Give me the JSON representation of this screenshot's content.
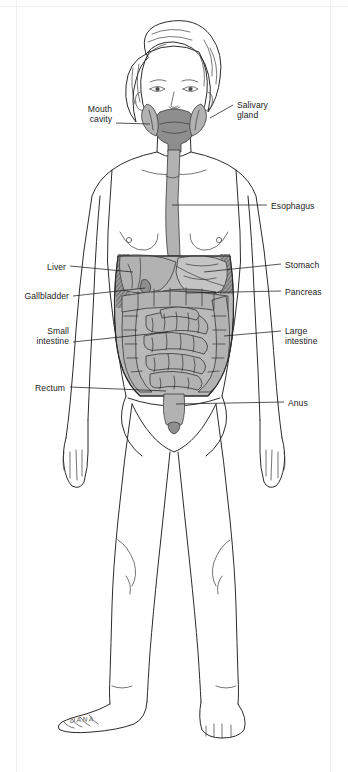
{
  "document": {
    "title": "Digestive system of the human body",
    "header_faint_text": " ",
    "signature": "DANA"
  },
  "figure": {
    "body_outline_color": "#2b2b2b",
    "organ_fill_color": "#b2b2b2",
    "organ_shade_color": "#8e8e8e",
    "organ_dark_color": "#4a4a4a",
    "background_color": "#ffffff"
  },
  "labels": [
    {
      "id": "mouth-cavity",
      "text": "Mouth\ncavity",
      "side": "left",
      "x": 68,
      "y": 104,
      "width": 44,
      "leader": {
        "x1": 116,
        "y1": 123,
        "x2": 150,
        "y2": 124
      }
    },
    {
      "id": "salivary-gland",
      "text": "Salivary\ngland",
      "side": "right",
      "x": 237,
      "y": 100,
      "width": 60,
      "leader": {
        "x1": 233,
        "y1": 105,
        "x2": 210,
        "y2": 118
      }
    },
    {
      "id": "esophagus",
      "text": "Esophagus",
      "side": "right",
      "x": 271,
      "y": 201,
      "width": 62,
      "leader": {
        "x1": 267,
        "y1": 205,
        "x2": 172,
        "y2": 205
      }
    },
    {
      "id": "liver",
      "text": "Liver",
      "side": "left",
      "x": 38,
      "y": 262,
      "width": 28,
      "leader": {
        "x1": 70,
        "y1": 266,
        "x2": 133,
        "y2": 272
      }
    },
    {
      "id": "stomach",
      "text": "Stomach",
      "side": "right",
      "x": 285,
      "y": 260,
      "width": 54,
      "leader": {
        "x1": 281,
        "y1": 264,
        "x2": 204,
        "y2": 272
      }
    },
    {
      "id": "gallbladder",
      "text": "Gallbladder",
      "side": "left",
      "x": 13,
      "y": 291,
      "width": 56,
      "leader": {
        "x1": 73,
        "y1": 296,
        "x2": 139,
        "y2": 290
      }
    },
    {
      "id": "pancreas",
      "text": "Pancreas",
      "side": "right",
      "x": 285,
      "y": 287,
      "width": 54,
      "leader": {
        "x1": 281,
        "y1": 291,
        "x2": 186,
        "y2": 293
      }
    },
    {
      "id": "small-intestine",
      "text": "Small\nintestine",
      "side": "left",
      "x": 20,
      "y": 326,
      "width": 49,
      "leader": {
        "x1": 73,
        "y1": 342,
        "x2": 168,
        "y2": 332
      }
    },
    {
      "id": "large-intestine",
      "text": "Large\nintestine",
      "side": "right",
      "x": 285,
      "y": 326,
      "width": 52,
      "leader": {
        "x1": 281,
        "y1": 331,
        "x2": 224,
        "y2": 336
      }
    },
    {
      "id": "rectum",
      "text": "Rectum",
      "side": "left",
      "x": 20,
      "y": 383,
      "width": 45,
      "leader": {
        "x1": 70,
        "y1": 387,
        "x2": 166,
        "y2": 391
      }
    },
    {
      "id": "anus",
      "text": "Anus",
      "side": "right",
      "x": 288,
      "y": 398,
      "width": 32,
      "leader": {
        "x1": 284,
        "y1": 402,
        "x2": 175,
        "y2": 404
      }
    }
  ]
}
